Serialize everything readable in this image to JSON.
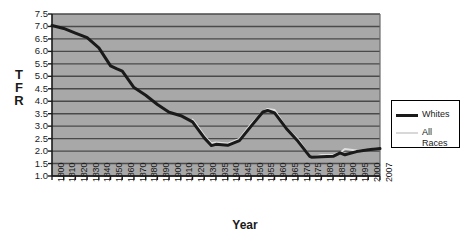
{
  "chart_data": {
    "type": "line",
    "title": "",
    "xlabel": "Year",
    "ylabel": "TFR",
    "ylim": [
      1.0,
      7.5
    ],
    "xlim": [
      1800,
      2007
    ],
    "grid": true,
    "legend_position": "right",
    "plot_background": "#a8a8a8",
    "gridline_color": "#4a4a4a",
    "ytick_labels": [
      "7.5",
      "7.0",
      "6.5",
      "6.0",
      "5.5",
      "5.0",
      "4.5",
      "4.0",
      "3.5",
      "3.0",
      "2.5",
      "2.0",
      "1.5",
      "1.0"
    ],
    "ytick_values": [
      7.5,
      7.0,
      6.5,
      6.0,
      5.5,
      5.0,
      4.5,
      4.0,
      3.5,
      3.0,
      2.5,
      2.0,
      1.5,
      1.0
    ],
    "xtick_labels": [
      "1800",
      "1810",
      "1820",
      "1830",
      "1840",
      "1850",
      "1860",
      "1870",
      "1880",
      "1890",
      "1900",
      "1910",
      "1920",
      "1930",
      "1935",
      "1940",
      "1945",
      "1950",
      "1955",
      "1960",
      "1965",
      "1970",
      "1975",
      "1980",
      "1985",
      "1990",
      "1995",
      "2000",
      "2007"
    ],
    "series": [
      {
        "name": "Whites",
        "color": "#1a1a1a",
        "width": 3.0,
        "x": [
          1800,
          1810,
          1820,
          1830,
          1840,
          1850,
          1855,
          1860,
          1870,
          1880,
          1890,
          1900,
          1910,
          1920,
          1925,
          1930,
          1933,
          1935,
          1940,
          1945,
          1950,
          1955,
          1957,
          1960,
          1965,
          1970,
          1975,
          1976,
          1980,
          1985,
          1988,
          1990,
          1995,
          2000,
          2007
        ],
        "y": [
          7.04,
          6.92,
          6.73,
          6.55,
          6.14,
          5.42,
          5.31,
          5.21,
          4.55,
          4.24,
          3.87,
          3.56,
          3.42,
          3.17,
          2.85,
          2.53,
          2.22,
          2.27,
          2.23,
          2.42,
          3.0,
          3.57,
          3.63,
          3.53,
          2.91,
          2.39,
          1.79,
          1.75,
          1.77,
          1.79,
          1.93,
          1.85,
          1.98,
          2.05,
          2.1
        ],
        "markers": false
      },
      {
        "name": "All Races",
        "color": "#e0e0e0",
        "width": 2.0,
        "x": [
          1920,
          1925,
          1930,
          1933,
          1935,
          1940,
          1945,
          1950,
          1955,
          1957,
          1960,
          1965,
          1970,
          1975,
          1976,
          1980,
          1985,
          1988,
          1990,
          1995,
          2000,
          2007
        ],
        "y": [
          3.26,
          2.95,
          2.62,
          2.31,
          2.34,
          2.3,
          2.49,
          3.09,
          3.58,
          3.69,
          3.65,
          2.93,
          2.48,
          1.8,
          1.74,
          1.84,
          1.84,
          1.93,
          2.08,
          2.02,
          2.06,
          2.12
        ],
        "markers": false
      }
    ]
  },
  "legend": {
    "entries": [
      {
        "label": "Whites",
        "color": "#1a1a1a"
      },
      {
        "label": "All\nRaces",
        "label_line1": "All",
        "label_line2": "Races",
        "color": "#dcdcdc"
      }
    ]
  },
  "axis_titles": {
    "y_letters": [
      "T",
      "F",
      "R"
    ],
    "x": "Year"
  }
}
